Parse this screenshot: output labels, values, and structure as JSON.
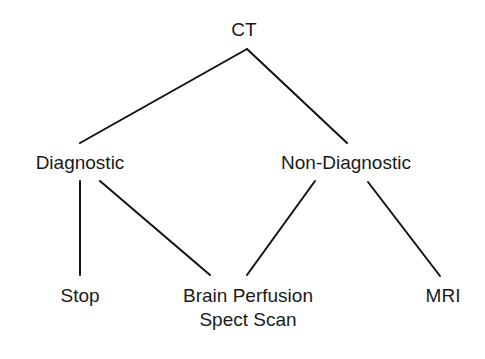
{
  "diagram": {
    "type": "tree",
    "nodes": {
      "root": {
        "label": "CT"
      },
      "diagnostic": {
        "label": "Diagnostic"
      },
      "non_diagnostic": {
        "label": "Non-Diagnostic"
      },
      "stop": {
        "label": "Stop"
      },
      "brain_perfusion": {
        "label_line1": "Brain Perfusion",
        "label_line2": "Spect Scan"
      },
      "mri": {
        "label": "MRI"
      }
    },
    "edges": [
      {
        "from": "CT",
        "to": "Diagnostic"
      },
      {
        "from": "CT",
        "to": "Non-Diagnostic"
      },
      {
        "from": "Diagnostic",
        "to": "Stop"
      },
      {
        "from": "Diagnostic",
        "to": "Brain Perfusion Spect Scan"
      },
      {
        "from": "Non-Diagnostic",
        "to": "Brain Perfusion Spect Scan"
      },
      {
        "from": "Non-Diagnostic",
        "to": "MRI"
      }
    ],
    "line_color": "#111111"
  }
}
